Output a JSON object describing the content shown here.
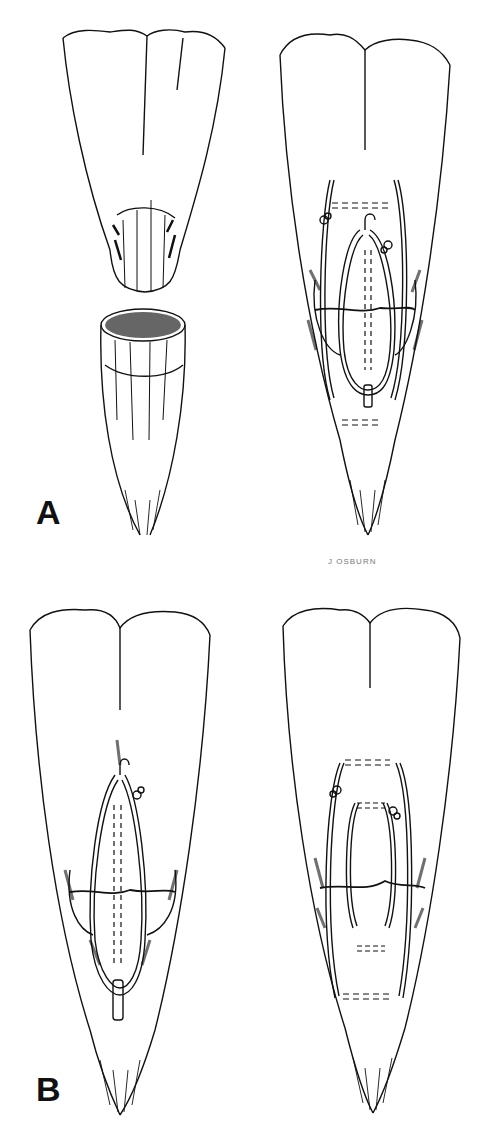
{
  "figure": {
    "panels": [
      {
        "id": "A-left",
        "description": "Tendon ends separated: proximal stump with rounded end and distal stump with exposed cut cross-section"
      },
      {
        "id": "A-right",
        "description": "Tendon repair with looped suture through both stumps, knots tied at sides"
      },
      {
        "id": "B-left",
        "description": "Single loop suture repair with central core suture"
      },
      {
        "id": "B-right",
        "description": "Double loop suture repair with two pairs of cross stitches"
      }
    ],
    "labels": {
      "a": "A",
      "b": "B"
    },
    "signature": "J OSBURN",
    "colors": {
      "ink": "#111111",
      "background": "#ffffff"
    }
  }
}
